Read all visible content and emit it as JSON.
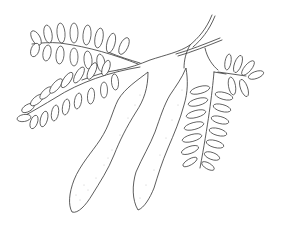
{
  "image": {
    "subject": "botanical line drawing",
    "description": "Branch with two elongated seed pods and three pinnate compound leaves",
    "colors": {
      "ink": "#333333",
      "background": "#ffffff",
      "stipple": "#888888"
    }
  }
}
